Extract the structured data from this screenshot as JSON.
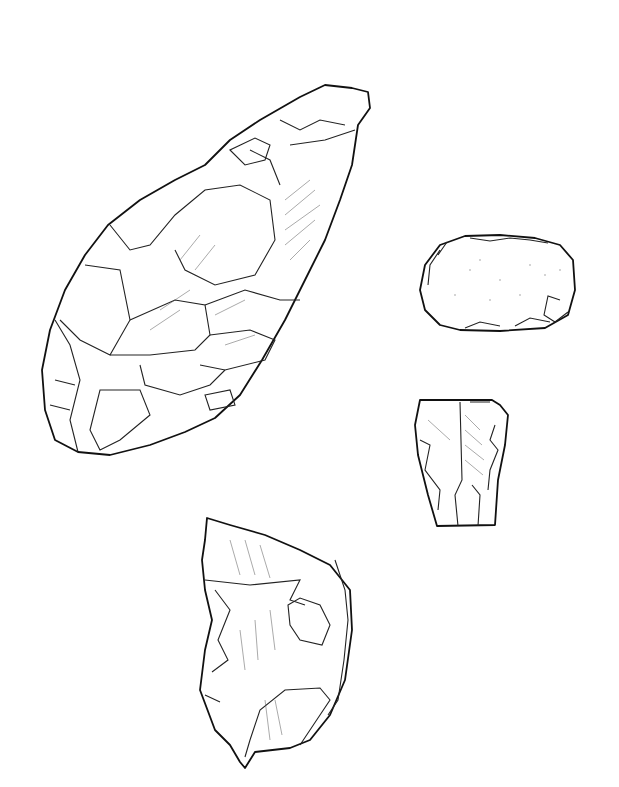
{
  "figure": {
    "artifacts": [
      {
        "name": "handaxe",
        "position": "upper-left"
      },
      {
        "name": "scraper-cortex",
        "position": "right-upper"
      },
      {
        "name": "blade-fragment",
        "position": "right-middle"
      },
      {
        "name": "flake-with-cortex",
        "position": "bottom-center"
      }
    ],
    "colors": {
      "line": "#111111",
      "background": "#ffffff"
    }
  }
}
